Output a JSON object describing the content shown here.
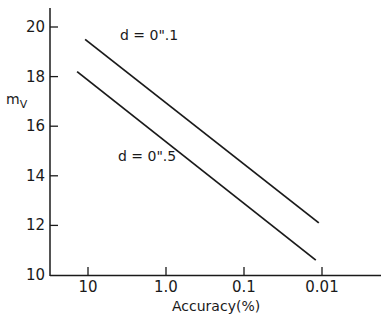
{
  "chart_data": {
    "type": "line",
    "title": "",
    "xlabel": "Accuracy(%)",
    "ylabel": "m_V",
    "ylabel_display": {
      "main": "m",
      "sub": "V"
    },
    "xscale": "log-reversed",
    "xlim": [
      14,
      0.0045
    ],
    "ylim": [
      10,
      20.7
    ],
    "x_ticks": [
      10,
      1.0,
      0.1,
      0.01
    ],
    "x_tick_labels": [
      "10",
      "1.0",
      "0.1",
      "0.01"
    ],
    "y_ticks": [
      10,
      12,
      14,
      16,
      18,
      20
    ],
    "y_tick_labels": [
      "10",
      "12",
      "14",
      "16",
      "18",
      "20"
    ],
    "grid": false,
    "legend": "none (inline annotations)",
    "series": [
      {
        "name": "d = 0\".1",
        "label": "d = 0\".1",
        "x": [
          10.9,
          0.011
        ],
        "y": [
          19.5,
          12.1
        ]
      },
      {
        "name": "d = 0\".5",
        "label": "d = 0\".5",
        "x": [
          13.8,
          0.012
        ],
        "y": [
          18.2,
          10.6
        ]
      }
    ],
    "annotations": [
      {
        "text": "d = 0\".1",
        "near_series": 0
      },
      {
        "text": "d = 0\".5",
        "near_series": 1
      }
    ]
  }
}
